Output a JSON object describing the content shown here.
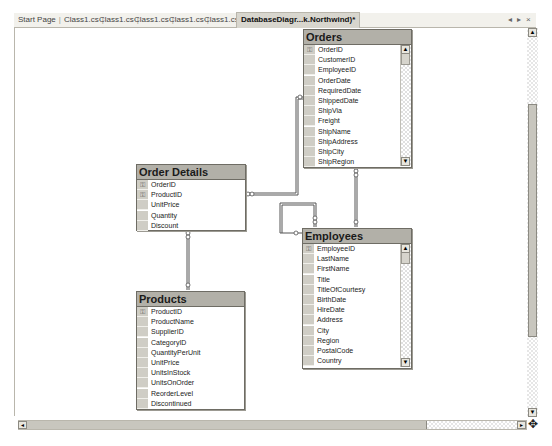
{
  "tabs": [
    {
      "label": "Start Page",
      "active": false
    },
    {
      "label": "Class1.cs",
      "active": false
    },
    {
      "label": "Class1.cs",
      "active": false
    },
    {
      "label": "Class1.cs",
      "active": false
    },
    {
      "label": "Class1.cs",
      "active": false
    },
    {
      "label": "Class1.cs",
      "active": false
    },
    {
      "label": "DatabaseDiagr...k.Northwind)*",
      "active": true
    }
  ],
  "tab_controls": {
    "prev": "◂",
    "next": "▸",
    "close": "×"
  },
  "tables": {
    "orders": {
      "title": "Orders",
      "columns": [
        "OrderID",
        "CustomerID",
        "EmployeeID",
        "OrderDate",
        "RequiredDate",
        "ShippedDate",
        "ShipVia",
        "Freight",
        "ShipName",
        "ShipAddress",
        "ShipCity",
        "ShipRegion"
      ],
      "keys": [
        true,
        false,
        false,
        false,
        false,
        false,
        false,
        false,
        false,
        false,
        false,
        false
      ]
    },
    "order_details": {
      "title": "Order Details",
      "columns": [
        "OrderID",
        "ProductID",
        "UnitPrice",
        "Quantity",
        "Discount"
      ],
      "keys": [
        true,
        true,
        false,
        false,
        false
      ]
    },
    "employees": {
      "title": "Employees",
      "columns": [
        "EmployeeID",
        "LastName",
        "FirstName",
        "Title",
        "TitleOfCourtesy",
        "BirthDate",
        "HireDate",
        "Address",
        "City",
        "Region",
        "PostalCode",
        "Country"
      ],
      "keys": [
        true,
        false,
        false,
        false,
        false,
        false,
        false,
        false,
        false,
        false,
        false,
        false
      ]
    },
    "products": {
      "title": "Products",
      "columns": [
        "ProductID",
        "ProductName",
        "SupplierID",
        "CategoryID",
        "QuantityPerUnit",
        "UnitPrice",
        "UnitsInStock",
        "UnitsOnOrder",
        "ReorderLevel",
        "Discontinued"
      ],
      "keys": [
        true,
        false,
        false,
        false,
        false,
        false,
        false,
        false,
        false,
        false
      ]
    }
  },
  "icons": {
    "key": "⚿",
    "scroll_up": "▲",
    "scroll_down": "▼",
    "scroll_left": "◂",
    "scroll_right": "▸",
    "move": "✥"
  }
}
